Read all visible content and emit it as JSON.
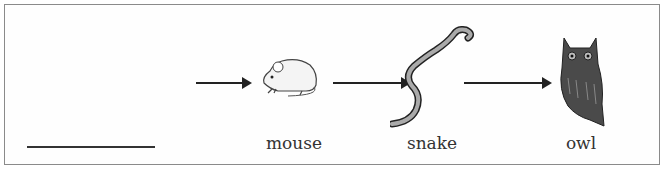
{
  "diagram": {
    "type": "food_chain",
    "blank_slot": {
      "text": ""
    },
    "organisms": [
      {
        "name": "mouse",
        "icon": "mouse-icon"
      },
      {
        "name": "snake",
        "icon": "snake-icon"
      },
      {
        "name": "owl",
        "icon": "owl-icon"
      }
    ],
    "arrows": [
      "blank-to-mouse",
      "mouse-to-snake",
      "snake-to-owl"
    ]
  }
}
